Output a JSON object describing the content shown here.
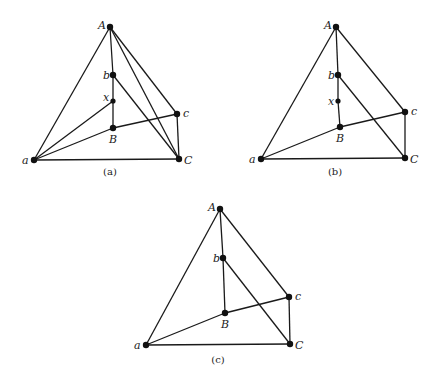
{
  "figure": {
    "panels": [
      {
        "id": "a",
        "caption": "(a)",
        "caption_pos": [
          110,
          175
        ],
        "nodes": [
          {
            "id": "A",
            "label": "A",
            "x": 110,
            "y": 27,
            "lx": -12,
            "ly": 2
          },
          {
            "id": "b",
            "label": "b",
            "x": 113,
            "y": 75,
            "lx": -10,
            "ly": 4
          },
          {
            "id": "x",
            "label": "x",
            "x": 113,
            "y": 101,
            "lx": -10,
            "ly": 0
          },
          {
            "id": "B",
            "label": "B",
            "x": 113,
            "y": 128,
            "lx": -4,
            "ly": 15
          },
          {
            "id": "c",
            "label": "c",
            "x": 177,
            "y": 114,
            "lx": 6,
            "ly": 3
          },
          {
            "id": "C",
            "label": "C",
            "x": 179,
            "y": 159,
            "lx": 5,
            "ly": 5
          },
          {
            "id": "a",
            "label": "a",
            "x": 34,
            "y": 160,
            "lx": -12,
            "ly": 4
          }
        ],
        "edges": [
          [
            "A",
            "a"
          ],
          [
            "A",
            "b"
          ],
          [
            "b",
            "x"
          ],
          [
            "x",
            "B"
          ],
          [
            "A",
            "c"
          ],
          [
            "A",
            "C"
          ],
          [
            "b",
            "C"
          ],
          [
            "a",
            "x"
          ],
          [
            "a",
            "B"
          ],
          [
            "B",
            "c"
          ],
          [
            "a",
            "C"
          ],
          [
            "c",
            "C"
          ]
        ]
      },
      {
        "id": "b",
        "caption": "(b)",
        "caption_pos": [
          335,
          175
        ],
        "nodes": [
          {
            "id": "A",
            "label": "A",
            "x": 336,
            "y": 27,
            "lx": -12,
            "ly": 2
          },
          {
            "id": "b",
            "label": "b",
            "x": 338,
            "y": 75,
            "lx": -10,
            "ly": 4
          },
          {
            "id": "x",
            "label": "x",
            "x": 338,
            "y": 101,
            "lx": -10,
            "ly": 4
          },
          {
            "id": "B",
            "label": "B",
            "x": 340,
            "y": 127,
            "lx": -4,
            "ly": 15
          },
          {
            "id": "c",
            "label": "c",
            "x": 405,
            "y": 112,
            "lx": 6,
            "ly": 3
          },
          {
            "id": "C",
            "label": "C",
            "x": 405,
            "y": 158,
            "lx": 5,
            "ly": 5
          },
          {
            "id": "a",
            "label": "a",
            "x": 261,
            "y": 159,
            "lx": -12,
            "ly": 4
          }
        ],
        "edges": [
          [
            "A",
            "a"
          ],
          [
            "A",
            "b"
          ],
          [
            "b",
            "x"
          ],
          [
            "x",
            "B"
          ],
          [
            "A",
            "c"
          ],
          [
            "b",
            "C"
          ],
          [
            "a",
            "B"
          ],
          [
            "B",
            "c"
          ],
          [
            "a",
            "C"
          ],
          [
            "c",
            "C"
          ]
        ]
      },
      {
        "id": "c",
        "caption": "(c)",
        "caption_pos": [
          218,
          363
        ],
        "nodes": [
          {
            "id": "A",
            "label": "A",
            "x": 220,
            "y": 209,
            "lx": -12,
            "ly": 2
          },
          {
            "id": "b",
            "label": "b",
            "x": 223,
            "y": 258,
            "lx": -10,
            "ly": 4
          },
          {
            "id": "B",
            "label": "B",
            "x": 225,
            "y": 313,
            "lx": -4,
            "ly": 15
          },
          {
            "id": "c",
            "label": "c",
            "x": 289,
            "y": 297,
            "lx": 6,
            "ly": 3
          },
          {
            "id": "C",
            "label": "C",
            "x": 290,
            "y": 344,
            "lx": 5,
            "ly": 5
          },
          {
            "id": "a",
            "label": "a",
            "x": 146,
            "y": 345,
            "lx": -12,
            "ly": 4
          }
        ],
        "edges": [
          [
            "A",
            "a"
          ],
          [
            "A",
            "b"
          ],
          [
            "b",
            "B"
          ],
          [
            "A",
            "c"
          ],
          [
            "b",
            "C"
          ],
          [
            "a",
            "B"
          ],
          [
            "B",
            "c"
          ],
          [
            "a",
            "C"
          ],
          [
            "c",
            "C"
          ]
        ]
      }
    ]
  }
}
